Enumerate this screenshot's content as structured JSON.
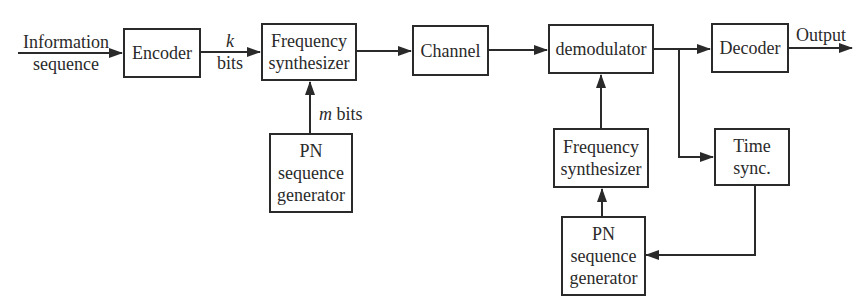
{
  "diagram": {
    "type": "block-diagram",
    "blocks": {
      "encoder": {
        "lines": [
          "Encoder"
        ]
      },
      "freq_synth_tx": {
        "lines": [
          "Frequency",
          "synthesizer"
        ]
      },
      "channel": {
        "lines": [
          "Channel"
        ]
      },
      "demodulator": {
        "lines": [
          "demodulator"
        ]
      },
      "decoder": {
        "lines": [
          "Decoder"
        ]
      },
      "pn_gen_tx": {
        "lines": [
          "PN",
          "sequence",
          "generator"
        ]
      },
      "freq_synth_rx": {
        "lines": [
          "Frequency",
          "synthesizer"
        ]
      },
      "time_sync": {
        "lines": [
          "Time",
          "sync."
        ]
      },
      "pn_gen_rx": {
        "lines": [
          "PN",
          "sequence",
          "generator"
        ]
      }
    },
    "labels": {
      "input": [
        "Information",
        "sequence"
      ],
      "k_var": "k",
      "k_unit": "bits",
      "m_var": "m",
      "m_unit": " bits",
      "output": "Output"
    },
    "edges": [
      {
        "from": "input",
        "to": "encoder"
      },
      {
        "from": "encoder",
        "to": "freq_synth_tx",
        "label": "k bits"
      },
      {
        "from": "pn_gen_tx",
        "to": "freq_synth_tx",
        "label": "m bits"
      },
      {
        "from": "freq_synth_tx",
        "to": "channel"
      },
      {
        "from": "channel",
        "to": "demodulator"
      },
      {
        "from": "demodulator",
        "to": "decoder"
      },
      {
        "from": "demodulator",
        "to": "time_sync"
      },
      {
        "from": "decoder",
        "to": "output"
      },
      {
        "from": "freq_synth_rx",
        "to": "demodulator"
      },
      {
        "from": "pn_gen_rx",
        "to": "freq_synth_rx"
      },
      {
        "from": "time_sync",
        "to": "pn_gen_rx"
      }
    ]
  },
  "colors": {
    "stroke": "#2a2a2a",
    "background": "#ffffff"
  }
}
